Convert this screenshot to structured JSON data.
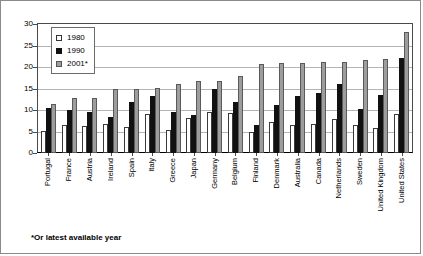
{
  "chart_data": {
    "type": "bar",
    "title": "",
    "xlabel": "",
    "ylabel": "",
    "ylim": [
      0,
      30
    ],
    "yticks": [
      0,
      5,
      10,
      15,
      20,
      25,
      30
    ],
    "grid": true,
    "legend_position": "top-left",
    "categories": [
      "Portugal",
      "France",
      "Austria",
      "Ireland",
      "Spain",
      "Italy",
      "Greece",
      "Japan",
      "Germany",
      "Belgium",
      "Finland",
      "Denmark",
      "Australia",
      "Canada",
      "Netherlands",
      "Sweden",
      "United Kingdom",
      "United States"
    ],
    "series": [
      {
        "name": "1980",
        "values": [
          5.1,
          6.6,
          6.3,
          6.8,
          6.1,
          9.1,
          5.3,
          8.1,
          9.6,
          9.3,
          4.9,
          7.1,
          6.6,
          6.8,
          8.0,
          6.6,
          5.9,
          9.0
        ]
      },
      {
        "name": "1990",
        "values": [
          10.4,
          9.9,
          9.5,
          8.4,
          11.9,
          13.3,
          9.6,
          8.9,
          15.0,
          11.9,
          6.6,
          11.2,
          13.2,
          14.0,
          16.0,
          10.3,
          13.5,
          22.1
        ]
      },
      {
        "name": "2001*",
        "values": [
          11.4,
          12.7,
          12.8,
          14.8,
          15.0,
          15.2,
          16.0,
          16.8,
          16.8,
          17.8,
          20.8,
          20.9,
          20.9,
          21.1,
          21.1,
          21.6,
          21.9,
          28.2
        ]
      }
    ],
    "footnote": "*Or latest available year"
  },
  "legend": {
    "items": [
      {
        "label": "1980",
        "color": "#ffffff"
      },
      {
        "label": "1990",
        "color": "#111111"
      },
      {
        "label": "2001*",
        "color": "#9d9d9d"
      }
    ]
  }
}
